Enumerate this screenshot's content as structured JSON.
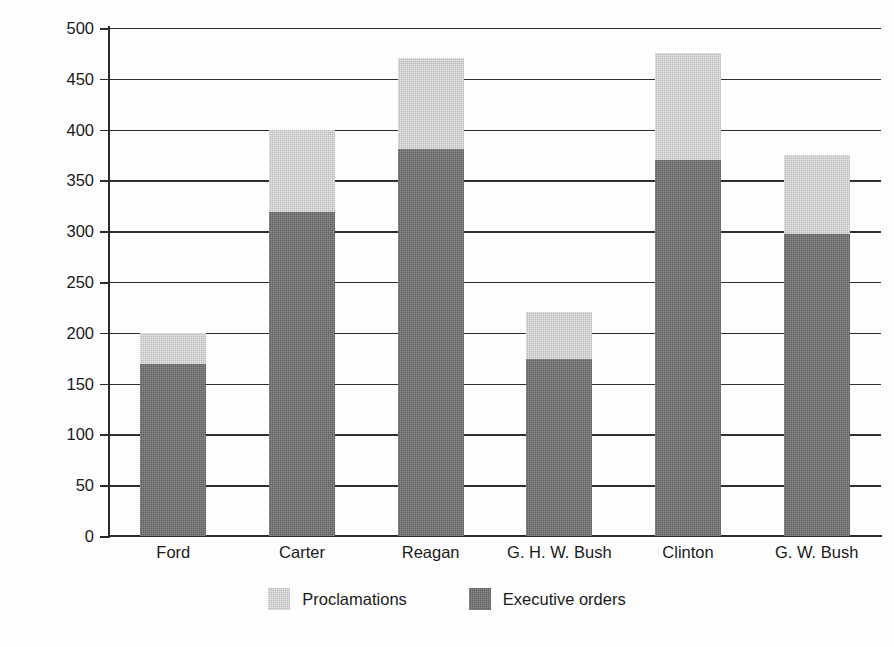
{
  "chart_data": {
    "type": "bar",
    "stacked": true,
    "title": "",
    "xlabel": "",
    "ylabel": "Number of orders",
    "ylim": [
      0,
      500
    ],
    "ytick_step": 50,
    "yticks": [
      500,
      450,
      400,
      350,
      300,
      250,
      200,
      150,
      100,
      50,
      0
    ],
    "ytick_labels": [
      "500",
      "450",
      "400",
      "350",
      "300",
      "250",
      "200",
      "150",
      "100",
      "50",
      "0"
    ],
    "grid": true,
    "grid_axis": "y",
    "legend_position": "bottom-center",
    "categories": [
      "Ford",
      "Carter",
      "Reagan",
      "G. H. W. Bush",
      "Clinton",
      "G. W. Bush"
    ],
    "series": [
      {
        "name": "Executive orders",
        "color": "#6d6d6d",
        "values": [
          169,
          319,
          381,
          174,
          370,
          297
        ]
      },
      {
        "name": "Proclamations",
        "color": "#d2d2d2",
        "values": [
          31,
          81,
          89,
          46,
          105,
          78
        ]
      }
    ],
    "totals": [
      200,
      400,
      470,
      220,
      475,
      375
    ],
    "stack_order_bottom_to_top": [
      "Executive orders",
      "Proclamations"
    ]
  },
  "axis": {
    "y_title": "Number of orders"
  },
  "legend": {
    "items": [
      {
        "label": "Proclamations",
        "swatch": "proclamations-swatch"
      },
      {
        "label": "Executive orders",
        "swatch": "executive-orders-swatch"
      }
    ]
  },
  "colors": {
    "executive_orders": "#6d6d6d",
    "proclamations": "#d2d2d2",
    "axis": "#2b2b2b",
    "gridline": "#2f2f2f",
    "background": "#fefefe",
    "text": "#1a1a1a"
  }
}
